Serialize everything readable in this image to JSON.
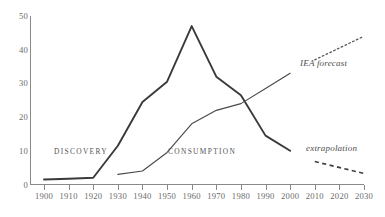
{
  "chart_data": {
    "type": "line",
    "title": "",
    "subtitle": "",
    "xlabel": "",
    "ylabel": "",
    "xlim": [
      1900,
      2030
    ],
    "ylim": [
      0,
      50
    ],
    "grid": false,
    "legend_position": "inline-annotations",
    "x_ticks": [
      "1900",
      "1910",
      "1920",
      "1930",
      "1940",
      "1950",
      "1960",
      "1970",
      "1980",
      "1990",
      "2000",
      "2010",
      "2020",
      "2030"
    ],
    "x_tick_values": [
      1900,
      1910,
      1920,
      1930,
      1940,
      1950,
      1960,
      1970,
      1980,
      1990,
      2000,
      2010,
      2020,
      2030
    ],
    "y_ticks": [
      "0",
      "10",
      "20",
      "30",
      "40",
      "50"
    ],
    "y_tick_values": [
      0,
      10,
      20,
      30,
      40,
      50
    ],
    "series": [
      {
        "name": "DISCOVERY",
        "style": "solid-thick",
        "color": "#3a3a3a",
        "x": [
          1900,
          1910,
          1920,
          1930,
          1940,
          1950,
          1960,
          1970,
          1980,
          1990,
          2000
        ],
        "values": [
          1.5,
          1.7,
          2.0,
          11.5,
          24.5,
          30.5,
          47.0,
          32.0,
          26.5,
          14.5,
          10.0
        ]
      },
      {
        "name": "CONSUMPTION",
        "style": "solid-thin",
        "color": "#4a4a4a",
        "x": [
          1930,
          1940,
          1950,
          1960,
          1970,
          1980,
          1990,
          2000
        ],
        "values": [
          3.0,
          4.0,
          9.5,
          18.0,
          22.0,
          24.0,
          28.5,
          33.0
        ]
      },
      {
        "name": "IEA forecast",
        "style": "dotted",
        "color": "#575757",
        "x": [
          2010,
          2030
        ],
        "values": [
          37.0,
          44.0
        ]
      },
      {
        "name": "extrapolation",
        "style": "dashed",
        "color": "#3f3f3f",
        "x": [
          2010,
          2030
        ],
        "values": [
          6.8,
          3.3
        ]
      }
    ],
    "annotations": [
      {
        "text": "DISCOVERY",
        "x": 1925,
        "y": 10
      },
      {
        "text": "CONSUMPTION",
        "x": 1975,
        "y": 10
      },
      {
        "text": "IEA forecast",
        "x": 2020,
        "y": 36
      },
      {
        "text": "extrapolation",
        "x": 2022,
        "y": 11
      }
    ]
  },
  "labels": {
    "discovery": "DISCOVERY",
    "consumption": "CONSUMPTION",
    "iea_forecast": "IEA forecast",
    "extrapolation": "extrapolation"
  },
  "colors": {
    "axis": "#8a8a8a",
    "discovery": "#3a3a3a",
    "consumption": "#4a4a4a",
    "forecast": "#575757",
    "extrapolation": "#3f3f3f",
    "text": "#555555",
    "background": "#ffffff"
  }
}
